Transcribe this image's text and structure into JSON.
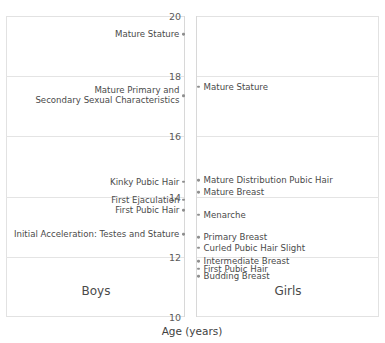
{
  "chart_data": {
    "type": "scatter",
    "title": "",
    "xlabel": "Age (years)",
    "ylabel": "",
    "ylim": [
      10,
      20
    ],
    "yticks": [
      10,
      12,
      14,
      16,
      18,
      20
    ],
    "ytick_labels": [
      "10",
      "12",
      "14",
      "16",
      "18",
      "20"
    ],
    "grid": true,
    "legend": "none",
    "axis_orientation": "age-on-vertical-axis",
    "panels": [
      {
        "name": "Boys",
        "caption": "Boys",
        "side": "left",
        "events": [
          {
            "label": "Mature Stature",
            "age": 19.4
          },
          {
            "label": "Mature Primary and\nSecondary Sexual Characteristics",
            "age": 17.35
          },
          {
            "label": "Kinky Pubic Hair",
            "age": 14.5
          },
          {
            "label": "First Ejaculation",
            "age": 13.9
          },
          {
            "label": "First Pubic Hair",
            "age": 13.55
          },
          {
            "label": "Initial Acceleration: Testes and Stature",
            "age": 12.75
          }
        ]
      },
      {
        "name": "Girls",
        "caption": "Girls",
        "side": "right",
        "events": [
          {
            "label": "Mature Stature",
            "age": 17.65
          },
          {
            "label": "Mature Distribution Pubic Hair",
            "age": 14.55
          },
          {
            "label": "Mature Breast",
            "age": 14.15
          },
          {
            "label": "Menarche",
            "age": 13.4
          },
          {
            "label": "Primary Breast",
            "age": 12.65
          },
          {
            "label": "Curled Pubic Hair Slight",
            "age": 12.3
          },
          {
            "label": "Intermediate Breast",
            "age": 11.85
          },
          {
            "label": "First Pubic Hair",
            "age": 11.6
          },
          {
            "label": "Budding Breast",
            "age": 11.35
          }
        ]
      }
    ],
    "colors": {
      "marker": "#8f8f8f",
      "grid": "#e4e4e4",
      "frame": "#e2e2e2",
      "text": "#4a4a4a"
    }
  }
}
